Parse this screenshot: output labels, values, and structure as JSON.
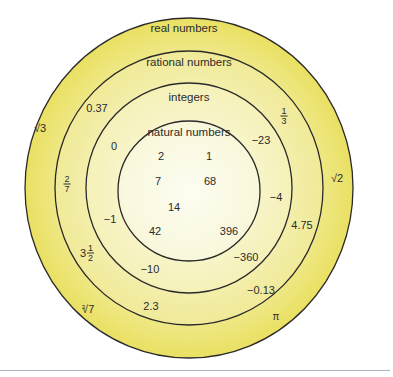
{
  "diagram": {
    "colors": {
      "real": "#ece46f",
      "rational": "#f2eda0",
      "integers": "#f6f3bf",
      "natural": "#fbfae4",
      "stroke": "#2a2a2a",
      "rule": "#a9b3c6"
    },
    "sets": {
      "real": {
        "label": "real numbers"
      },
      "rational": {
        "label": "rational numbers"
      },
      "integers": {
        "label": "integers"
      },
      "natural": {
        "label": "natural numbers"
      }
    },
    "real_only": {
      "sqrt3": "√3",
      "sqrt2": "√2",
      "cbrt7_index": "3",
      "cbrt7_radicand": "√7",
      "pi": "π"
    },
    "rational_only": {
      "n037": "0.37",
      "one_third_num": "1",
      "one_third_den": "3",
      "two_sevenths_num": "2",
      "two_sevenths_den": "7",
      "three_half_whole": "3",
      "three_half_num": "1",
      "three_half_den": "2",
      "n475": "4.75",
      "n013": "−0.13",
      "n23": "2.3"
    },
    "integers_only": {
      "zero": "0",
      "neg23": "−23",
      "neg4": "−4",
      "neg1": "−1",
      "neg360": "−360",
      "neg10": "−10"
    },
    "natural": {
      "n2": "2",
      "n1": "1",
      "n7": "7",
      "n68": "68",
      "n14": "14",
      "n42": "42",
      "n396": "396"
    }
  }
}
